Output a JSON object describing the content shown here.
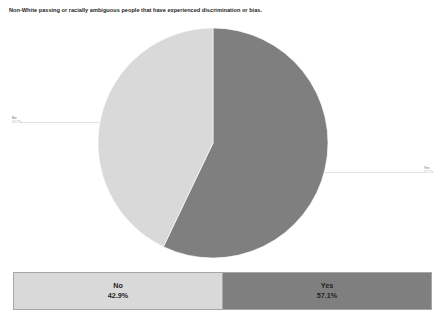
{
  "chart": {
    "title": "Non-White passing or racially ambiguous people that have experienced discrimination or bias."
  },
  "labels": {
    "no": {
      "name": "No",
      "percent": "42.9%"
    },
    "yes": {
      "name": "Yes",
      "percent": "57.1%"
    }
  },
  "legend": {
    "columns": [
      {
        "label": "No",
        "value": "42.9%",
        "color": "#d9d9d9"
      },
      {
        "label": "Yes",
        "value": "57.1%",
        "color": "#7f7f7f"
      }
    ]
  },
  "chart_data": {
    "type": "pie",
    "title": "Non-White passing or racially ambiguous people that have experienced discrimination or bias.",
    "categories": [
      "No",
      "Yes"
    ],
    "values": [
      42.9,
      57.1
    ],
    "value_labels": [
      "42.9%",
      "57.1%"
    ],
    "colors": [
      "#d9d9d9",
      "#7f7f7f"
    ],
    "units": "percent",
    "start_angle_deg": 0,
    "direction": "clockwise",
    "legend_position": "bottom-table",
    "grid": false,
    "xlabel": "",
    "ylabel": "",
    "slices": [
      {
        "name": "Yes",
        "percent": 57.1,
        "color": "#7f7f7f",
        "sweep_deg": 205.56,
        "label_side": "right"
      },
      {
        "name": "No",
        "percent": 42.9,
        "color": "#d9d9d9",
        "sweep_deg": 154.44,
        "label_side": "left"
      }
    ]
  }
}
